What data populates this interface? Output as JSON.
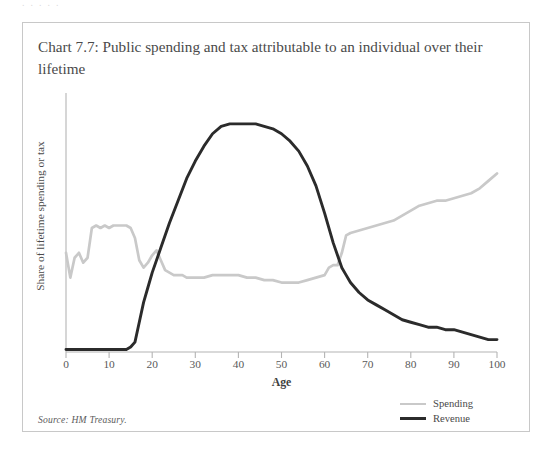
{
  "page": {
    "top_edge_artifact": "∙ ∙ ∙ ∙ ∙"
  },
  "title": "Chart 7.7: Public spending and tax attributable to an individual over their lifetime",
  "source": "Source: HM Treasury.",
  "legend": {
    "position": "bottom-right",
    "items": [
      {
        "label": "Spending",
        "color": "#c9c9c9"
      },
      {
        "label": "Revenue",
        "color": "#2b2b2b"
      }
    ]
  },
  "chart_data": {
    "type": "line",
    "title": "Chart 7.7: Public spending and tax attributable to an individual over their lifetime",
    "xlabel": "Age",
    "ylabel": "Share of lifetime spending or tax",
    "xlim": [
      0,
      100
    ],
    "ylim": [
      0,
      100
    ],
    "xticks": [
      0,
      10,
      20,
      30,
      40,
      50,
      60,
      70,
      80,
      90,
      100
    ],
    "yticks": [],
    "grid": false,
    "legend_position": "bottom-right",
    "note": "Y axis is unlabelled; values are share of lifetime spending or tax in arbitrary units read off the plot.",
    "series": [
      {
        "name": "Spending",
        "color": "#c9c9c9",
        "x": [
          0,
          1,
          2,
          3,
          4,
          5,
          6,
          7,
          8,
          9,
          10,
          11,
          12,
          13,
          14,
          15,
          16,
          17,
          18,
          19,
          20,
          21,
          22,
          23,
          24,
          25,
          26,
          27,
          28,
          30,
          32,
          34,
          36,
          38,
          40,
          42,
          44,
          46,
          48,
          50,
          52,
          54,
          56,
          58,
          60,
          61,
          62,
          63,
          64,
          65,
          66,
          68,
          70,
          72,
          74,
          76,
          78,
          80,
          82,
          84,
          86,
          88,
          90,
          92,
          94,
          96,
          98,
          100
        ],
        "y": [
          40,
          30,
          38,
          40,
          36,
          38,
          50,
          51,
          50,
          51,
          50,
          51,
          51,
          51,
          51,
          50,
          46,
          37,
          34,
          36,
          39,
          41,
          37,
          33,
          32,
          31,
          31,
          31,
          30,
          30,
          30,
          31,
          31,
          31,
          31,
          30,
          30,
          29,
          29,
          28,
          28,
          28,
          29,
          30,
          31,
          34,
          35,
          35,
          40,
          47,
          48,
          49,
          50,
          51,
          52,
          53,
          55,
          57,
          59,
          60,
          61,
          61,
          62,
          63,
          64,
          66,
          69,
          72
        ]
      },
      {
        "name": "Revenue",
        "color": "#2b2b2b",
        "x": [
          0,
          2,
          4,
          6,
          8,
          10,
          12,
          14,
          15,
          16,
          17,
          18,
          19,
          20,
          22,
          24,
          26,
          28,
          30,
          32,
          34,
          36,
          38,
          40,
          42,
          44,
          46,
          48,
          50,
          52,
          54,
          56,
          58,
          60,
          62,
          64,
          65,
          66,
          68,
          70,
          72,
          74,
          76,
          78,
          80,
          82,
          84,
          86,
          88,
          90,
          92,
          94,
          96,
          98,
          100
        ],
        "y": [
          1,
          1,
          1,
          1,
          1,
          1,
          1,
          1,
          2,
          4,
          12,
          20,
          26,
          32,
          42,
          52,
          61,
          70,
          77,
          83,
          88,
          91,
          92,
          92,
          92,
          92,
          91,
          90,
          88,
          85,
          81,
          75,
          67,
          56,
          44,
          34,
          31,
          28,
          24,
          21,
          19,
          17,
          15,
          13,
          12,
          11,
          10,
          10,
          9,
          9,
          8,
          7,
          6,
          5,
          5
        ]
      }
    ]
  },
  "axes": {
    "x_tick_labels": [
      "0",
      "10",
      "20",
      "30",
      "40",
      "50",
      "60",
      "70",
      "80",
      "90",
      "100"
    ],
    "x_title": "Age",
    "y_title": "Share of lifetime spending or tax"
  }
}
